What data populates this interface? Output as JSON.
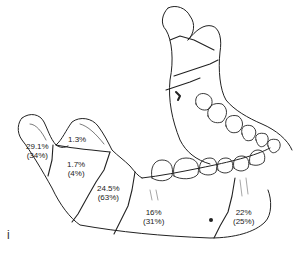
{
  "figure": {
    "panel_label": "i",
    "regions": [
      {
        "name": "condyle",
        "primary": "29.1%",
        "secondary": "(34%)"
      },
      {
        "name": "coronoid",
        "primary": "1.3%",
        "secondary": ""
      },
      {
        "name": "ramus",
        "primary": "1.7%",
        "secondary": "(4%)"
      },
      {
        "name": "angle",
        "primary": "24.5%",
        "secondary": "(63%)"
      },
      {
        "name": "body",
        "primary": "16%",
        "secondary": "(31%)"
      },
      {
        "name": "symphysis-parasymphysis",
        "primary": "22%",
        "secondary": "(25%)"
      }
    ],
    "colors": {
      "line": "#222222",
      "background": "#ffffff"
    }
  }
}
